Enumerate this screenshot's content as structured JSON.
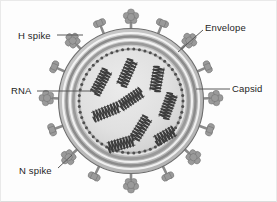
{
  "figure": {
    "background_color": "#fdfdfd",
    "border_color": "#e9e9e9"
  },
  "labels": {
    "h_spike": "H spike",
    "rna": "RNA",
    "n_spike": "N spike",
    "envelope": "Envelope",
    "capsid": "Capsid"
  },
  "colors": {
    "outline": "#4a4a4a",
    "envelope_outer": "#b9b9b9",
    "envelope_mid": "#8f8f8f",
    "envelope_inner": "#cfcfcf",
    "capsid_ring": "#4f4f4f",
    "core_fill": "#dedede",
    "spike_fill": "#9a9a9a",
    "spike_stem": "#8a8a8a",
    "rna_coil": "#3c3c3c",
    "leader_line": "#5a5a5a",
    "text": "#1d1d1d"
  },
  "structure": {
    "center": {
      "x": 131,
      "y": 101
    },
    "radii": {
      "spike_tip": 92,
      "envelope_outer": 72,
      "envelope_band_1": 68,
      "envelope_band_2": 63,
      "envelope_band_3": 58,
      "capsid_ring": 52,
      "core": 50
    },
    "envelope_layer_count": 4,
    "capsid_bead_count": 58
  },
  "spikes": {
    "h_spike_label_note": "cloverleaf / flower-shaped head on a short stem",
    "n_spike_label_note": "dumbbell, two-lobed head on a short stem",
    "items": [
      {
        "angle": -90,
        "type": "h"
      },
      {
        "angle": -68,
        "type": "n"
      },
      {
        "angle": -112,
        "type": "n"
      },
      {
        "angle": -46,
        "type": "h"
      },
      {
        "angle": -134,
        "type": "h"
      },
      {
        "angle": -24,
        "type": "n"
      },
      {
        "angle": -156,
        "type": "n"
      },
      {
        "angle": -2,
        "type": "h"
      },
      {
        "angle": -178,
        "type": "h"
      },
      {
        "angle": 20,
        "type": "n"
      },
      {
        "angle": 160,
        "type": "n"
      },
      {
        "angle": 42,
        "type": "h"
      },
      {
        "angle": 138,
        "type": "h"
      },
      {
        "angle": 64,
        "type": "n"
      },
      {
        "angle": 116,
        "type": "n"
      },
      {
        "angle": 90,
        "type": "h"
      }
    ]
  },
  "rna_segments": [
    {
      "cx": 101,
      "cy": 82,
      "angle": -62,
      "length": 27,
      "turns": 9
    },
    {
      "cx": 127,
      "cy": 73,
      "angle": -66,
      "length": 28,
      "turns": 9
    },
    {
      "cx": 157,
      "cy": 79,
      "angle": -80,
      "length": 25,
      "turns": 8
    },
    {
      "cx": 131,
      "cy": 99,
      "angle": -34,
      "length": 26,
      "turns": 9
    },
    {
      "cx": 168,
      "cy": 106,
      "angle": -70,
      "length": 26,
      "turns": 9
    },
    {
      "cx": 106,
      "cy": 112,
      "angle": -22,
      "length": 28,
      "turns": 9
    },
    {
      "cx": 141,
      "cy": 128,
      "angle": -58,
      "length": 25,
      "turns": 8
    },
    {
      "cx": 121,
      "cy": 144,
      "angle": -16,
      "length": 27,
      "turns": 9
    },
    {
      "cx": 165,
      "cy": 136,
      "angle": -30,
      "length": 22,
      "turns": 7
    }
  ],
  "leaders": [
    {
      "name": "h-spike",
      "x1": 57,
      "y1": 35,
      "x2": 83,
      "y2": 35
    },
    {
      "name": "rna",
      "x1": 37,
      "y1": 91,
      "x2": 98,
      "y2": 91
    },
    {
      "name": "n-spike",
      "x1": 58,
      "y1": 168,
      "x2": 72,
      "y2": 155
    },
    {
      "name": "envelope",
      "x1": 203,
      "y1": 30,
      "x2": 178,
      "y2": 52
    },
    {
      "name": "capsid",
      "x1": 230,
      "y1": 89,
      "x2": 196,
      "y2": 89
    }
  ]
}
